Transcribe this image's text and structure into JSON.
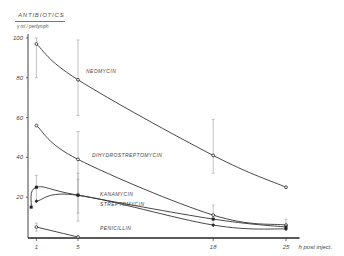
{
  "header": {
    "title": "ANTIBIOTICS",
    "unit": "γ ml / perilymph"
  },
  "chart_data": {
    "type": "line",
    "title": "ANTIBIOTICS",
    "ylabel": "γ ml / perilymph",
    "xlabel": "h  post inject.",
    "x_ticks": [
      "1",
      "5",
      "18",
      "25"
    ],
    "y_ticks": [
      "20",
      "40",
      "60",
      "80",
      "100"
    ],
    "xlim": [
      0,
      26
    ],
    "ylim": [
      0,
      100
    ],
    "grid": false,
    "legend_position": "inline labels",
    "series": [
      {
        "name": "NEOMYCIN",
        "x": [
          1,
          5,
          18,
          25
        ],
        "values": [
          97,
          79,
          41,
          25
        ],
        "error_bars": [
          [
            80,
            100
          ],
          [
            61,
            99
          ],
          [
            32,
            59
          ],
          null
        ]
      },
      {
        "name": "DIHYDROSTREPTOMYCIN",
        "x": [
          1,
          5,
          18,
          25
        ],
        "values": [
          56,
          39,
          11,
          6
        ],
        "error_bars": [
          null,
          [
            22,
            53
          ],
          [
            6,
            16
          ],
          [
            4,
            9
          ]
        ]
      },
      {
        "name": "KANAMYCIN",
        "x": [
          0.5,
          1,
          5,
          18,
          25
        ],
        "values": [
          15,
          25,
          21,
          9,
          5
        ],
        "error_bars": [
          null,
          [
            18,
            31
          ],
          [
            12,
            32
          ],
          null,
          null
        ]
      },
      {
        "name": "STREPTOMYCIN",
        "x": [
          1,
          5,
          18,
          25
        ],
        "values": [
          18,
          21,
          6,
          4
        ],
        "error_bars": [
          null,
          [
            8,
            29
          ],
          null,
          null
        ]
      },
      {
        "name": "PENICILLIN",
        "x": [
          1,
          5
        ],
        "values": [
          5,
          0
        ],
        "error_bars": [
          [
            3,
            7
          ],
          null
        ]
      }
    ]
  }
}
